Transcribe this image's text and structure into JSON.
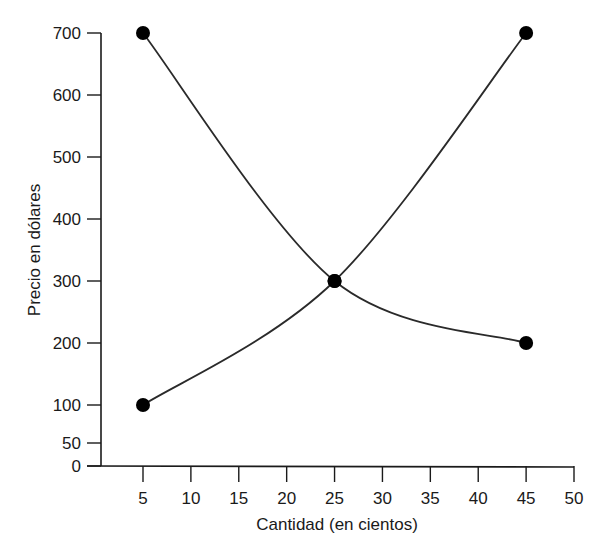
{
  "chart_data": {
    "type": "line",
    "title": "",
    "xlabel": "Cantidad (en cientos)",
    "ylabel": "Precio en dólares",
    "x_ticks": [
      5,
      10,
      15,
      20,
      25,
      30,
      35,
      40,
      45,
      50
    ],
    "y_ticks": [
      0,
      50,
      100,
      200,
      300,
      400,
      500,
      600,
      700
    ],
    "xlim": [
      0,
      50
    ],
    "ylim": [
      0,
      700
    ],
    "grid": false,
    "legend": null,
    "series": [
      {
        "name": "Curva descendente",
        "points": [
          {
            "x": 5,
            "y": 700
          },
          {
            "x": 25,
            "y": 300
          },
          {
            "x": 45,
            "y": 200
          }
        ],
        "markers_at": [
          5,
          25,
          45
        ]
      },
      {
        "name": "Curva ascendente",
        "points": [
          {
            "x": 5,
            "y": 100
          },
          {
            "x": 25,
            "y": 300
          },
          {
            "x": 45,
            "y": 700
          }
        ],
        "markers_at": [
          5,
          25,
          45
        ]
      }
    ],
    "annotations": [
      {
        "type": "intersection",
        "x": 25,
        "y": 300
      }
    ],
    "colors": {
      "line": "#2a2a2a",
      "marker": "#000000",
      "axis": "#1a1a1a"
    }
  }
}
